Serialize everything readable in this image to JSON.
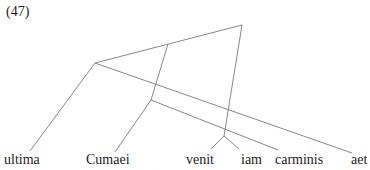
{
  "example_number": "(47)",
  "words": [
    {
      "text": "ultima",
      "x": 4,
      "y": 152
    },
    {
      "text": "Cumaei",
      "x": 86,
      "y": 152
    },
    {
      "text": "venit",
      "x": 186,
      "y": 152
    },
    {
      "text": "iam",
      "x": 241,
      "y": 152
    },
    {
      "text": "carminis",
      "x": 275,
      "y": 152
    },
    {
      "text": "aet",
      "x": 351,
      "y": 152
    }
  ],
  "edges": [
    {
      "x1": 95,
      "y1": 63,
      "x2": 242,
      "y2": 25
    },
    {
      "x1": 242,
      "y1": 25,
      "x2": 224,
      "y2": 136
    },
    {
      "x1": 224,
      "y1": 136,
      "x2": 211,
      "y2": 149
    },
    {
      "x1": 224,
      "y1": 136,
      "x2": 239,
      "y2": 149
    },
    {
      "x1": 95,
      "y1": 63,
      "x2": 30,
      "y2": 151
    },
    {
      "x1": 95,
      "y1": 63,
      "x2": 352,
      "y2": 153
    },
    {
      "x1": 168,
      "y1": 44,
      "x2": 151,
      "y2": 100
    },
    {
      "x1": 151,
      "y1": 100,
      "x2": 115,
      "y2": 152
    },
    {
      "x1": 151,
      "y1": 100,
      "x2": 278,
      "y2": 150
    }
  ]
}
